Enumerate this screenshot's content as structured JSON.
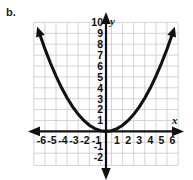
{
  "panel": {
    "label": "b."
  },
  "chart_data": {
    "type": "line",
    "title": "",
    "xlabel": "x",
    "ylabel": "y",
    "equation": "y = x^2 / 4",
    "xlim": [
      -6.5,
      6.5
    ],
    "ylim": [
      -2,
      10
    ],
    "grid": true,
    "grid_color": "#c9c9c9",
    "curve_color": "#111111",
    "axis_color": "#111111",
    "background": "#ffffff",
    "legend": "none",
    "x_tick_labels": [
      "-6",
      "-5",
      "-4",
      "-3",
      "-2",
      "-1",
      "1",
      "2",
      "3",
      "4",
      "5",
      "6"
    ],
    "x_tick_values": [
      -6,
      -5,
      -4,
      -3,
      -2,
      -1,
      1,
      2,
      3,
      4,
      5,
      6
    ],
    "y_tick_labels": [
      "10",
      "9",
      "8",
      "7",
      "6",
      "5",
      "4",
      "3",
      "2",
      "1",
      "-1",
      "-2"
    ],
    "y_tick_values": [
      10,
      9,
      8,
      7,
      6,
      5,
      4,
      3,
      2,
      1,
      -1,
      -2
    ],
    "series": [
      {
        "name": "parabola",
        "x": [
          -6,
          -5.5,
          -5,
          -4.5,
          -4,
          -3.5,
          -3,
          -2.5,
          -2,
          -1.5,
          -1,
          -0.5,
          0,
          0.5,
          1,
          1.5,
          2,
          2.5,
          3,
          3.5,
          4,
          4.5,
          5,
          5.5,
          6
        ],
        "y": [
          9,
          7.5625,
          6.25,
          5.0625,
          4,
          3.0625,
          2.25,
          1.5625,
          1,
          0.5625,
          0.25,
          0.0625,
          0,
          0.0625,
          0.25,
          0.5625,
          1,
          1.5625,
          2.25,
          3.0625,
          4,
          5.0625,
          6.25,
          7.5625,
          9
        ],
        "arrow_start": true,
        "arrow_end": true
      }
    ],
    "vertex": {
      "x": 0,
      "y": 0
    }
  }
}
